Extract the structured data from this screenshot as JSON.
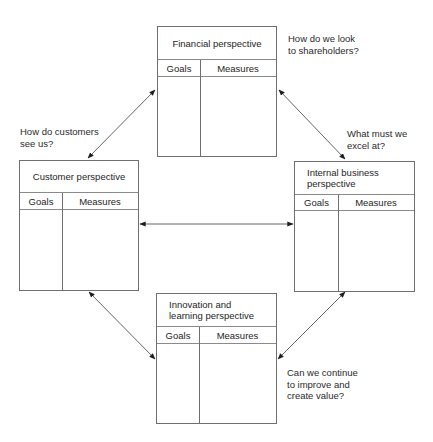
{
  "diagram": {
    "boxes": {
      "financial": {
        "title": "Financial perspective",
        "col1": "Goals",
        "col2": "Measures"
      },
      "customer": {
        "title": "Customer perspective",
        "col1": "Goals",
        "col2": "Measures"
      },
      "internal": {
        "title": "Internal business\nperspective",
        "col1": "Goals",
        "col2": "Measures"
      },
      "innovation": {
        "title": "Innovation and\nlearning perspective",
        "col1": "Goals",
        "col2": "Measures"
      }
    },
    "questions": {
      "financial": "How do we look\nto shareholders?",
      "customer": "How do customers\nsee us?",
      "internal": "What must we\nexcel at?",
      "innovation": "Can we continue\nto improve and\ncreate value?"
    },
    "connections": [
      {
        "from": "financial",
        "to": "customer",
        "type": "bidirectional"
      },
      {
        "from": "financial",
        "to": "internal",
        "type": "bidirectional"
      },
      {
        "from": "customer",
        "to": "internal",
        "type": "bidirectional"
      },
      {
        "from": "customer",
        "to": "innovation",
        "type": "bidirectional"
      },
      {
        "from": "internal",
        "to": "innovation",
        "type": "bidirectional"
      }
    ]
  }
}
